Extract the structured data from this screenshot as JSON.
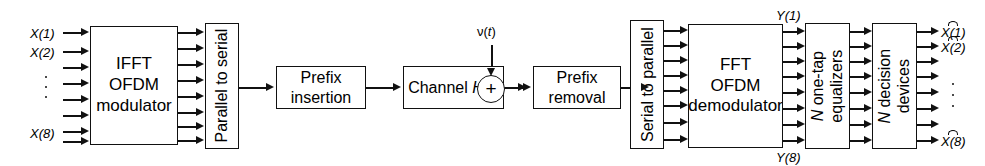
{
  "diagram": {
    "stroke_color": "#111111",
    "background_color": "#ffffff"
  },
  "inputs": {
    "labels": [
      "X(1)",
      "X(2)",
      "X(8)"
    ],
    "count": 8,
    "ellipsis": "vertical-dots"
  },
  "blocks": {
    "ifft_modulator": {
      "line1": "IFFT",
      "line2": "OFDM",
      "line3": "modulator"
    },
    "parallel_to_serial": {
      "label": "Parallel to serial"
    },
    "prefix_insertion": {
      "line1": "Prefix",
      "line2": "insertion"
    },
    "channel": {
      "text": "Channel ",
      "symbol": "H(f)"
    },
    "prefix_removal": {
      "line1": "Prefix",
      "line2": "removal"
    },
    "serial_to_parallel": {
      "label": "Serial to parallel"
    },
    "fft_demodulator": {
      "line1": "FFT",
      "line2": "OFDM",
      "line3": "demodulator"
    },
    "equalizers": {
      "line1": "N one-tap",
      "line2": "equalizers",
      "italic_prefix": "N"
    },
    "decision_devices": {
      "line1": "N decision",
      "line2": "devices",
      "italic_prefix": "N"
    }
  },
  "noise": {
    "label": "v(t)",
    "symbol_nu": "ν",
    "symbol_t": "t",
    "adder": "+"
  },
  "intermediate_signals": {
    "top": "Y(1)",
    "bottom": "Y(8)"
  },
  "outputs": {
    "labels": [
      "X(1)",
      "X(2)",
      "X(8)"
    ],
    "hat": true,
    "count": 8,
    "ellipsis": "vertical-dots"
  }
}
